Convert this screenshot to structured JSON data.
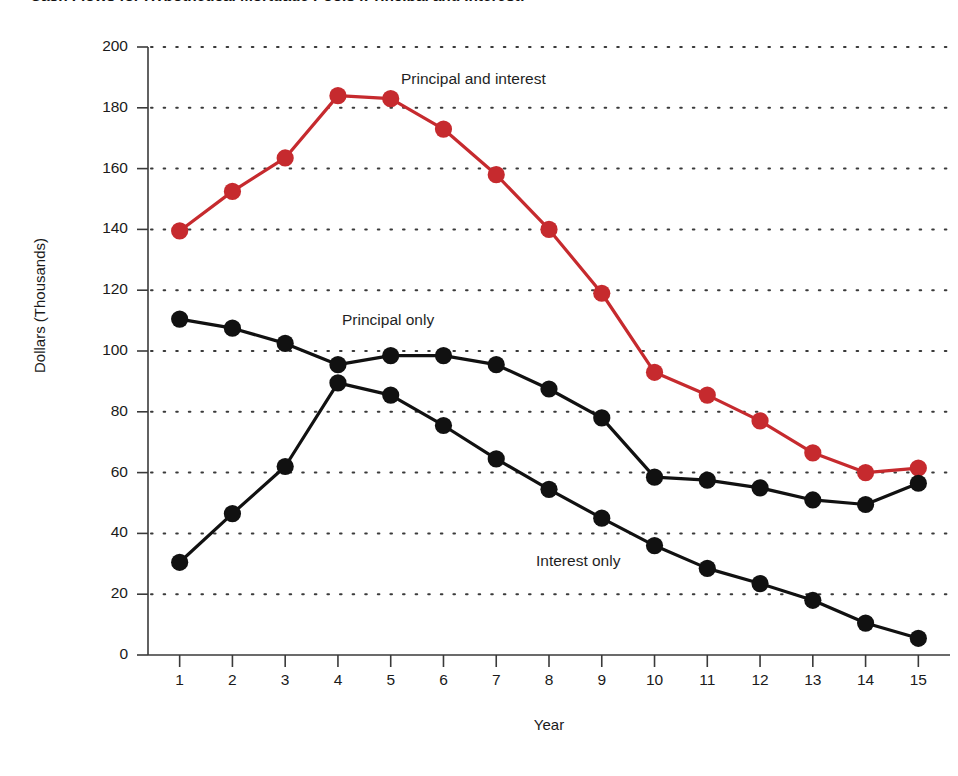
{
  "chart_data": {
    "type": "line",
    "title": "Cash Flows for Hypothetical Mortgage Pools (Principal and Interest)",
    "xlabel": "Year",
    "ylabel": "Dollars (Thousands)",
    "x": [
      1,
      2,
      3,
      4,
      5,
      6,
      7,
      8,
      9,
      10,
      11,
      12,
      13,
      14,
      15
    ],
    "categories": [
      "1",
      "2",
      "3",
      "4",
      "5",
      "6",
      "7",
      "8",
      "9",
      "10",
      "11",
      "12",
      "13",
      "14",
      "15"
    ],
    "xlim": [
      0.4,
      15.6
    ],
    "ylim": [
      0,
      200
    ],
    "yticks": [
      0,
      20,
      40,
      60,
      80,
      100,
      120,
      140,
      160,
      180,
      200
    ],
    "ytick_labels": [
      "0",
      "20",
      "40",
      "60",
      "80",
      "100",
      "120",
      "140",
      "160",
      "180",
      "200"
    ],
    "xticks": [
      1,
      2,
      3,
      4,
      5,
      6,
      7,
      8,
      9,
      10,
      11,
      12,
      13,
      14,
      15
    ],
    "grid": "horizontal-dotted",
    "legend_position": "inline-annotations",
    "series": [
      {
        "name": "Principal and interest",
        "color": "#c62a2e",
        "marker": "circle",
        "values": [
          139.5,
          152.5,
          163.5,
          184,
          183,
          173,
          158,
          140,
          119,
          93,
          85.5,
          77,
          66.5,
          60,
          61.5
        ]
      },
      {
        "name": "Principal only",
        "color": "#111111",
        "marker": "circle",
        "values": [
          110.5,
          107.5,
          102.5,
          95.5,
          98.5,
          98.5,
          95.5,
          87.5,
          78,
          58.5,
          57.5,
          55,
          51,
          49.5,
          56.5
        ]
      },
      {
        "name": "Interest only",
        "color": "#111111",
        "marker": "circle",
        "values": [
          30.5,
          46.5,
          62,
          89.5,
          85.5,
          75.5,
          64.5,
          54.5,
          45,
          36,
          28.5,
          23.5,
          18,
          10.5,
          5.5
        ]
      }
    ],
    "annotations": [
      {
        "text": "Principal and interest",
        "x": 5.6,
        "y": 192
      },
      {
        "text": "Principal only",
        "x": 4.5,
        "y": 111
      },
      {
        "text": "Interest only",
        "x": 8.2,
        "y": 32
      }
    ]
  },
  "axes": {
    "y_title": "Dollars (Thousands)",
    "x_title": "Year"
  },
  "labels": {
    "principal_and_interest": "Principal and interest",
    "principal_only": "Principal only",
    "interest_only": "Interest only"
  },
  "colors": {
    "red_series": "#c62a2e",
    "black_series": "#111111",
    "gridline": "#3a3a3a",
    "axis": "#3a3a3a",
    "background": "#ffffff"
  }
}
